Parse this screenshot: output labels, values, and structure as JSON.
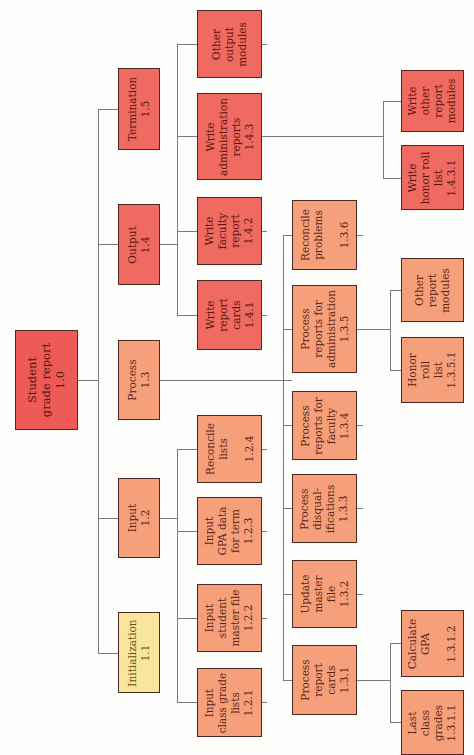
{
  "diagram": {
    "colors": {
      "root": "#ee5a56",
      "output_termination": "#ef6a60",
      "process_input": "#f6a07b",
      "initialization": "#f9e59b",
      "connector": "#7a7a7a"
    },
    "nodes": {
      "root": {
        "label": "Student\ngrade report\n1.0"
      },
      "n15": {
        "label": "Termination\n1.5"
      },
      "n14": {
        "label": "Output\n1.4"
      },
      "n13": {
        "label": "Process\n1.3"
      },
      "n12": {
        "label": "Input\n1.2"
      },
      "n11": {
        "label": "Initialization\n1.1"
      },
      "n14other": {
        "label": "Other\noutput\nmodules"
      },
      "n143": {
        "label": "Write\nadministration\nreports\n1.4.3"
      },
      "n142": {
        "label": "Write\nfaculty\nreport\n1.4.2"
      },
      "n141": {
        "label": "Write\nreport\ncards\n1.4.1"
      },
      "n124": {
        "label": "Reconcile\nlists\n\n1.2.4"
      },
      "n123": {
        "label": "Input\nGPA data\nfor term\n1.2.3"
      },
      "n122": {
        "label": "Input\nstudent\nmaster file\n1.2.2"
      },
      "n121": {
        "label": "Input\nclass grade\nlists\n1.2.1"
      },
      "n136": {
        "label": "Reconcile\nproblems\n\n1.3.6"
      },
      "n135": {
        "label": "Process\nreports for\nadministration\n1.3.5"
      },
      "n134": {
        "label": "Process\nreports for\nfaculty\n1.3.4"
      },
      "n133": {
        "label": "Process\ndisqual-\nifications\n1.3.3"
      },
      "n132": {
        "label": "Update\nmaster\nfile\n1.3.2"
      },
      "n131": {
        "label": "Process\nreport\ncards\n1.3.1"
      },
      "n143other": {
        "label": "Write\nother\nreport\nmodules"
      },
      "n1431": {
        "label": "Write\nhonor roll\nlist\n1.4.3.1"
      },
      "n135other": {
        "label": "Other\nreport\nmodules"
      },
      "n1351": {
        "label": "Honor\nroll\nlist\n1.3.5.1"
      },
      "n1312": {
        "label": "Calculate\nGPA\n\n1.3.1.2"
      },
      "n1311": {
        "label": "Last\nclass\ngrades\n1.3.1.1"
      }
    }
  }
}
